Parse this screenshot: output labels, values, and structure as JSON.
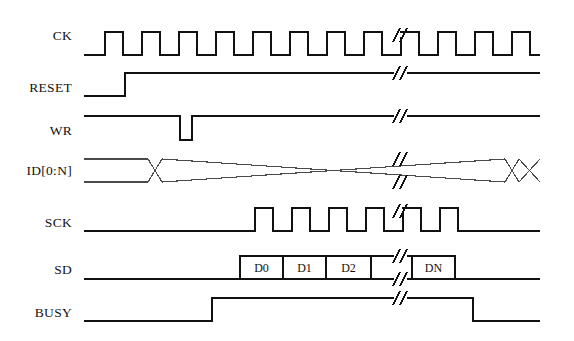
{
  "figure": {
    "kind": "digital-timing-diagram",
    "background_color": "#ffffff",
    "line_color": "#111111",
    "bus_line_color": "#4a4a4a",
    "width": 574,
    "height": 341
  },
  "signals": [
    {
      "name": "CK",
      "label": "CK",
      "type": "clock",
      "row_y_high": 32,
      "row_y_low": 55,
      "label_x_right": 72,
      "label_y": 36,
      "start_x": 84,
      "end_x": 540,
      "break_x": 400,
      "clock": {
        "first_rise_x": 105,
        "period_px": 37,
        "high_width_px": 18,
        "pulses_before_break": 8,
        "pulses_after_break": 4
      }
    },
    {
      "name": "RESET",
      "label": "RESET",
      "type": "level",
      "row_y_high": 73,
      "row_y_low": 96,
      "label_x_right": 72,
      "label_y": 88,
      "start_x": 84,
      "end_x": 540,
      "break_x": 400,
      "transitions": [
        {
          "x": 125,
          "edge": "rise"
        }
      ],
      "initial_level": "low"
    },
    {
      "name": "WR",
      "label": "WR",
      "type": "level",
      "row_y_high": 116,
      "row_y_low": 140,
      "label_x_right": 72,
      "label_y": 131,
      "start_x": 84,
      "end_x": 540,
      "break_x": 400,
      "transitions": [
        {
          "x": 180,
          "edge": "fall"
        },
        {
          "x": 192,
          "edge": "rise"
        }
      ],
      "initial_level": "high"
    },
    {
      "name": "ID[0:N]",
      "label": "ID[0:N]",
      "type": "bus",
      "row_y_high": 159,
      "row_y_low": 182,
      "label_x_right": 72,
      "label_y": 171,
      "start_x": 84,
      "end_x": 540,
      "break_x": 400,
      "crossings": [
        {
          "x": 155,
          "width": 14
        },
        {
          "x": 512,
          "width": 14
        }
      ]
    },
    {
      "name": "SCK",
      "label": "SCK",
      "type": "clock-burst",
      "row_y_high": 208,
      "row_y_low": 231,
      "label_x_right": 72,
      "label_y": 223,
      "start_x": 84,
      "end_x": 540,
      "break_x": 400,
      "burst": {
        "first_rise_x": 255,
        "period_px": 37,
        "high_width_px": 18,
        "pulses_before_break": 4,
        "pulses_after_break": 2,
        "idle_resume_x": 450
      },
      "initial_level": "low"
    },
    {
      "name": "SD",
      "label": "SD",
      "type": "data",
      "row_y_high": 256,
      "row_y_low": 279,
      "label_x_right": 72,
      "label_y": 270,
      "start_x": 84,
      "end_x": 540,
      "break_x": 400,
      "data_window": {
        "x_start": 240,
        "x_end": 455
      },
      "boxes": [
        {
          "label": "D0",
          "x_start": 240,
          "x_end": 283
        },
        {
          "label": "D1",
          "x_start": 283,
          "x_end": 326
        },
        {
          "label": "D2",
          "x_start": 326,
          "x_end": 371
        },
        {
          "label": "",
          "x_start": 371,
          "x_end": 412
        },
        {
          "label": "DN",
          "x_start": 412,
          "x_end": 455
        }
      ]
    },
    {
      "name": "BUSY",
      "label": "BUSY",
      "type": "level",
      "row_y_high": 298,
      "row_y_low": 321,
      "label_x_right": 72,
      "label_y": 313,
      "start_x": 84,
      "end_x": 540,
      "break_x": 400,
      "transitions": [
        {
          "x": 212,
          "edge": "rise"
        },
        {
          "x": 473,
          "edge": "fall"
        }
      ],
      "initial_level": "low"
    }
  ],
  "break_marker": {
    "glyph": "//",
    "description": "double-slash time-break marker",
    "slash_dx": 7,
    "slash_half_height": 7,
    "slash_gap": 7
  }
}
